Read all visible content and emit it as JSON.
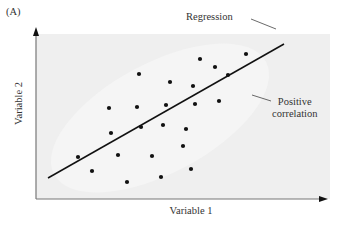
{
  "figure": {
    "panel_label": "(A)",
    "x_axis_label": "Variable 1",
    "y_axis_label": "Variable 2",
    "annotations": {
      "regression": "Regression",
      "positive_correlation_line1": "Positive",
      "positive_correlation_line2": "correlation"
    },
    "colors": {
      "plot_background": "#efefef",
      "axis": "#777777",
      "points": "#111111",
      "regression_line": "#111111"
    }
  },
  "chart_data": {
    "type": "scatter",
    "title": "(A)",
    "xlabel": "Variable 1",
    "ylabel": "Variable 2",
    "grid": false,
    "ticks": "none",
    "annotations": [
      "Regression",
      "Positive correlation"
    ],
    "pixel_points": [
      [
        200,
        59
      ],
      [
        246,
        54
      ],
      [
        215,
        67
      ],
      [
        228,
        75
      ],
      [
        139,
        74
      ],
      [
        170,
        82
      ],
      [
        193,
        86
      ],
      [
        109,
        108
      ],
      [
        137,
        107
      ],
      [
        166,
        105
      ],
      [
        195,
        104
      ],
      [
        219,
        101
      ],
      [
        111,
        133
      ],
      [
        141,
        127
      ],
      [
        163,
        125
      ],
      [
        186,
        129
      ],
      [
        78,
        157
      ],
      [
        118,
        155
      ],
      [
        152,
        156
      ],
      [
        183,
        146
      ],
      [
        92,
        171
      ],
      [
        127,
        182
      ],
      [
        161,
        177
      ],
      [
        191,
        169
      ]
    ],
    "regression_line_pixels": [
      [
        48,
        178
      ],
      [
        284,
        44
      ]
    ],
    "axes_pixels": {
      "origin": [
        36,
        199
      ],
      "x_end": [
        327,
        199
      ],
      "y_end": [
        36,
        28
      ]
    }
  }
}
